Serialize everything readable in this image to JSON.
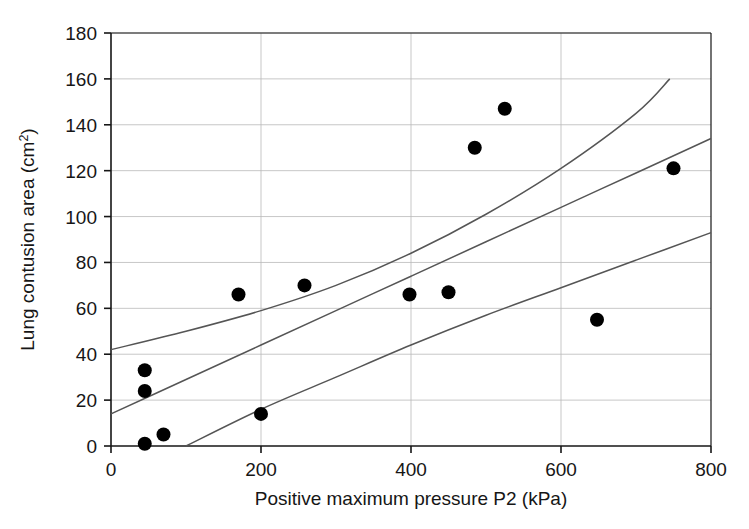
{
  "chart_data": {
    "type": "scatter",
    "title": "",
    "xlabel": "Positive maximum pressure P2 (kPa)",
    "ylabel": "Lung contusion area (cm²)",
    "ylabel_base": "Lung contusion area (cm",
    "ylabel_sup": "2",
    "ylabel_tail": ")",
    "xlim": [
      0,
      800
    ],
    "ylim": [
      0,
      180
    ],
    "xticks": [
      0,
      200,
      400,
      600,
      800
    ],
    "yticks": [
      0,
      20,
      40,
      60,
      80,
      100,
      120,
      140,
      160,
      180
    ],
    "xtick_labels": [
      "0",
      "200",
      "400",
      "600",
      "800"
    ],
    "ytick_labels": [
      "0",
      "20",
      "40",
      "60",
      "80",
      "100",
      "120",
      "140",
      "160",
      "180"
    ],
    "grid": {
      "horizontal": true,
      "vertical": true,
      "color": "#b9b9b9"
    },
    "frame": true,
    "legend": null,
    "marker": {
      "shape": "circle",
      "color": "#000000",
      "radius_px": 7
    },
    "points": [
      {
        "x": 45,
        "y": 1
      },
      {
        "x": 45,
        "y": 24
      },
      {
        "x": 45,
        "y": 33
      },
      {
        "x": 70,
        "y": 5
      },
      {
        "x": 170,
        "y": 66
      },
      {
        "x": 200,
        "y": 14
      },
      {
        "x": 258,
        "y": 70
      },
      {
        "x": 398,
        "y": 66
      },
      {
        "x": 450,
        "y": 67
      },
      {
        "x": 485,
        "y": 130
      },
      {
        "x": 525,
        "y": 147
      },
      {
        "x": 648,
        "y": 55
      },
      {
        "x": 750,
        "y": 121
      }
    ],
    "series": [
      {
        "name": "regression-fit",
        "type": "line",
        "color": "#555555",
        "points": [
          {
            "x": 0,
            "y": 14
          },
          {
            "x": 100,
            "y": 29
          },
          {
            "x": 200,
            "y": 44
          },
          {
            "x": 300,
            "y": 59
          },
          {
            "x": 400,
            "y": 74
          },
          {
            "x": 500,
            "y": 89
          },
          {
            "x": 600,
            "y": 104
          },
          {
            "x": 700,
            "y": 119
          },
          {
            "x": 800,
            "y": 134
          }
        ]
      },
      {
        "name": "upper-confidence-band",
        "type": "line",
        "color": "#555555",
        "points": [
          {
            "x": 0,
            "y": 42
          },
          {
            "x": 100,
            "y": 50
          },
          {
            "x": 200,
            "y": 59
          },
          {
            "x": 300,
            "y": 70
          },
          {
            "x": 400,
            "y": 84
          },
          {
            "x": 500,
            "y": 101
          },
          {
            "x": 600,
            "y": 121
          },
          {
            "x": 700,
            "y": 145
          },
          {
            "x": 745,
            "y": 160
          }
        ]
      },
      {
        "name": "lower-confidence-band",
        "type": "line",
        "color": "#555555",
        "points": [
          {
            "x": 100,
            "y": 0
          },
          {
            "x": 200,
            "y": 16
          },
          {
            "x": 300,
            "y": 30
          },
          {
            "x": 400,
            "y": 44
          },
          {
            "x": 500,
            "y": 57
          },
          {
            "x": 600,
            "y": 69
          },
          {
            "x": 700,
            "y": 81
          },
          {
            "x": 800,
            "y": 93
          }
        ]
      }
    ]
  },
  "colors": {
    "background": "#ffffff",
    "axis": "#161616",
    "grid": "#b9b9b9",
    "marker": "#000000",
    "curve": "#555555"
  }
}
